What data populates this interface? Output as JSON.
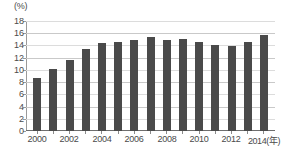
{
  "chart_data": {
    "type": "bar",
    "title": "",
    "xlabel": "(年)",
    "ylabel": "(%)",
    "ylim": [
      0,
      18
    ],
    "ytick_step": 2,
    "grid": true,
    "legend": "none",
    "bar_color": "#4a4a4a",
    "categories": [
      "2000",
      "2001",
      "2002",
      "2003",
      "2004",
      "2005",
      "2006",
      "2007",
      "2008",
      "2009",
      "2010",
      "2011",
      "2012",
      "2013",
      "2014"
    ],
    "values": [
      8.7,
      10.2,
      11.6,
      13.5,
      14.4,
      14.5,
      14.9,
      15.4,
      14.9,
      15.0,
      14.5,
      14.1,
      13.9,
      14.6,
      15.7
    ],
    "ytick_labels": [
      "18",
      "16",
      "14",
      "12",
      "10",
      "8",
      "6",
      "4",
      "2",
      "0"
    ],
    "ytick_values": [
      18,
      16,
      14,
      12,
      10,
      8,
      6,
      4,
      2,
      0
    ],
    "xtick_labels": [
      "2000",
      "2002",
      "2004",
      "2006",
      "2008",
      "2010",
      "2012",
      "2014(年)"
    ],
    "xtick_categories": [
      "2000",
      "2002",
      "2004",
      "2006",
      "2008",
      "2010",
      "2012",
      "2014"
    ]
  }
}
